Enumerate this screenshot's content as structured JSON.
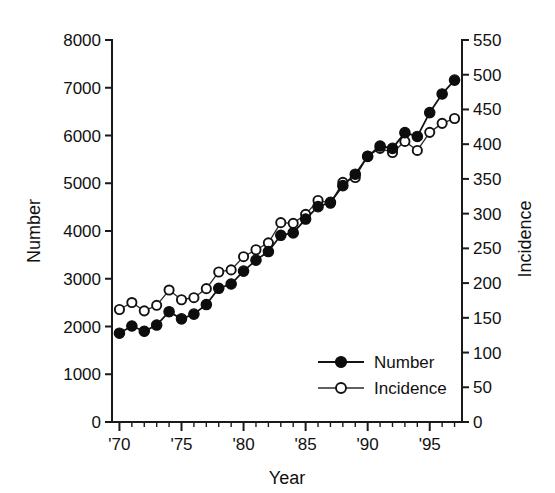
{
  "chart_data": {
    "type": "line",
    "title": "",
    "subtitle": "",
    "xlabel": "Year",
    "ylabel": "Number",
    "y2label": "Incidence",
    "grid": false,
    "legend_position": "inside-bottom-right",
    "x": [
      1970,
      1971,
      1972,
      1973,
      1974,
      1975,
      1976,
      1977,
      1978,
      1979,
      1980,
      1981,
      1982,
      1983,
      1984,
      1985,
      1986,
      1987,
      1988,
      1989,
      1990,
      1991,
      1992,
      1993,
      1994,
      1995,
      1996,
      1997
    ],
    "xtick_labels": [
      "'70",
      "'75",
      "'80",
      "'85",
      "'90",
      "'95"
    ],
    "xtick_values": [
      1970,
      1975,
      1980,
      1985,
      1990,
      1995
    ],
    "xlim": [
      1969.4,
      1997.6
    ],
    "ylim": [
      0,
      8000
    ],
    "ytick_values": [
      0,
      1000,
      2000,
      3000,
      4000,
      5000,
      6000,
      7000,
      8000
    ],
    "ytick_labels": [
      "0",
      "1000",
      "2000",
      "3000",
      "4000",
      "5000",
      "6000",
      "7000",
      "8000"
    ],
    "y2lim": [
      0,
      550
    ],
    "y2tick_values": [
      0,
      50,
      100,
      150,
      200,
      250,
      300,
      350,
      400,
      450,
      500,
      550
    ],
    "y2tick_labels": [
      "0",
      "50",
      "100",
      "150",
      "200",
      "250",
      "300",
      "350",
      "400",
      "450",
      "500",
      "550"
    ],
    "series": [
      {
        "name": "Number",
        "axis": "left",
        "marker": "filled-circle",
        "color": "#0d0d0d",
        "values": [
          1860,
          2010,
          1900,
          2030,
          2310,
          2160,
          2260,
          2460,
          2800,
          2890,
          3160,
          3390,
          3570,
          3910,
          3960,
          4250,
          4510,
          4600,
          4950,
          5190,
          5560,
          5780,
          5730,
          6060,
          5980,
          6480,
          6870,
          7160
        ]
      },
      {
        "name": "Incidence",
        "axis": "right",
        "marker": "open-circle",
        "color": "#ffffff",
        "values": [
          162,
          172,
          160,
          168,
          190,
          176,
          179,
          192,
          216,
          219,
          238,
          248,
          258,
          287,
          286,
          299,
          319,
          315,
          345,
          352,
          383,
          394,
          388,
          404,
          391,
          417,
          430,
          437
        ]
      }
    ],
    "legend": [
      {
        "label": "Number",
        "marker": "filled-circle"
      },
      {
        "label": "Incidence",
        "marker": "open-circle"
      }
    ]
  }
}
